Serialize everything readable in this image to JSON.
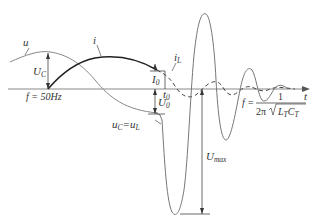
{
  "diagram": {
    "type": "waveform",
    "axis": {
      "time_label": "t"
    },
    "curves": [
      {
        "id": "u",
        "label": "u",
        "style": "thin gray sinusoid (supply voltage)"
      },
      {
        "id": "i",
        "label": "i",
        "style": "bold black arc (current)"
      },
      {
        "id": "iL",
        "label": "i",
        "label_sub": "L",
        "style": "dashed damped oscillation"
      },
      {
        "id": "uC_uL",
        "label": "u",
        "label_sub": "C",
        "eq": "=",
        "label2": "u",
        "label2_sub": "L",
        "style": "thin gray large damped oscillation"
      }
    ],
    "annotations": {
      "UC": {
        "main": "U",
        "sub": "C"
      },
      "I0": {
        "main": "I",
        "sub": "0"
      },
      "t0": {
        "main": "t",
        "sub": "0"
      },
      "U0": {
        "main": "U",
        "sub": "0"
      },
      "Umax": {
        "main": "U",
        "sub": "max"
      },
      "f_supply": "f = 50Hz",
      "f_res": {
        "lhs": "f =",
        "num": "1",
        "den_prefix": "2π",
        "den_L": "L",
        "den_L_sub": "T",
        "den_C": "C",
        "den_C_sub": "T"
      }
    }
  }
}
